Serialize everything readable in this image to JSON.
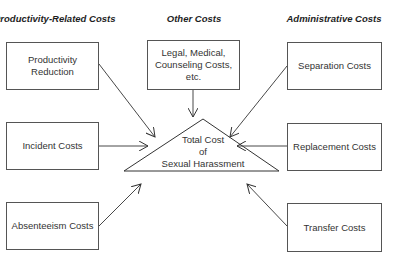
{
  "headers": {
    "left": "Productivity-Related Costs",
    "center": "Other Costs",
    "right": "Administrative Costs"
  },
  "boxes": {
    "productivity": "Productivity Reduction",
    "incident": "Incident Costs",
    "absenteeism": "Absenteeism Costs",
    "other_line1": "Legal, Medical,",
    "other_line2": "Counseling Costs,",
    "other_line3": "etc.",
    "separation": "Separation Costs",
    "replacement": "Replacement Costs",
    "transfer": "Transfer Costs"
  },
  "center": {
    "line1": "Total Cost",
    "line2": "of",
    "line3": "Sexual Harassment"
  },
  "colors": {
    "line": "#333333",
    "border": "#555555"
  }
}
